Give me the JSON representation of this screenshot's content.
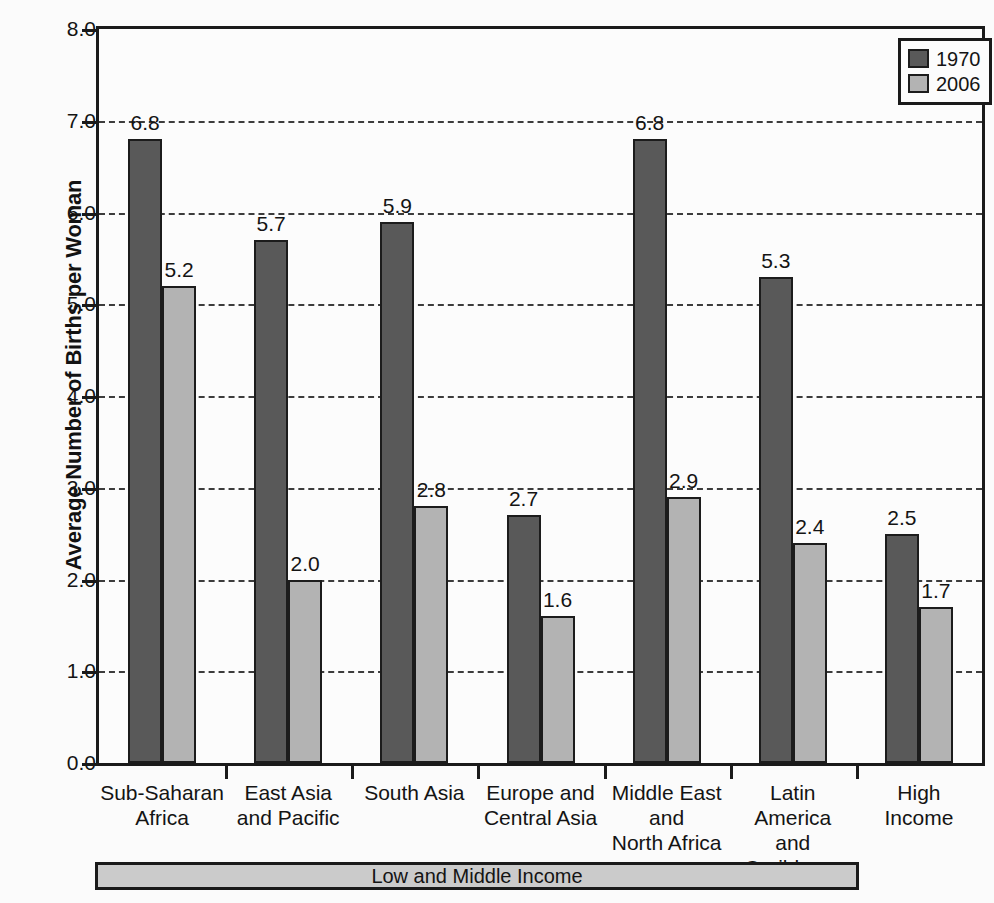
{
  "chart_data": {
    "type": "bar",
    "title": "",
    "xlabel": "",
    "ylabel": "Average Number of Births per Woman",
    "ylim": [
      0.0,
      8.0
    ],
    "ytick_labels": [
      "0.0",
      "1.0",
      "2.0",
      "3.0",
      "4.0",
      "5.0",
      "6.0",
      "7.0",
      "8.0"
    ],
    "ytick_values": [
      0.0,
      1.0,
      2.0,
      3.0,
      4.0,
      5.0,
      6.0,
      7.0,
      8.0
    ],
    "grid": true,
    "grid_axis": "y",
    "legend_position": "top-right",
    "categories": [
      "Sub-Saharan Africa",
      "East Asia and Pacific",
      "South Asia",
      "Europe and Central Asia",
      "Middle East and North Africa",
      "Latin America and Caribbean",
      "High Income"
    ],
    "category_lines": [
      [
        "Sub-Saharan",
        "Africa"
      ],
      [
        "East Asia",
        "and Pacific"
      ],
      [
        "South Asia"
      ],
      [
        "Europe and",
        "Central Asia"
      ],
      [
        "Middle East",
        "and",
        "North Africa"
      ],
      [
        "Latin America",
        "and",
        "Caribbean"
      ],
      [
        "High",
        "Income"
      ]
    ],
    "series": [
      {
        "name": "1970",
        "color": "#595959",
        "values": [
          6.8,
          5.7,
          5.9,
          2.7,
          6.8,
          5.3,
          2.5
        ],
        "labels": [
          "6.8",
          "5.7",
          "5.9",
          "2.7",
          "6.8",
          "5.3",
          "2.5"
        ]
      },
      {
        "name": "2006",
        "color": "#b3b3b3",
        "values": [
          5.2,
          2.0,
          2.8,
          1.6,
          2.9,
          2.4,
          1.7
        ],
        "labels": [
          "5.2",
          "2.0",
          "2.8",
          "1.6",
          "2.9",
          "2.4",
          "1.7"
        ]
      }
    ],
    "annotations": [
      {
        "text": "Low and Middle Income",
        "spans_categories": [
          "Sub-Saharan Africa",
          "East Asia and Pacific",
          "South Asia",
          "Europe and Central Asia",
          "Middle East and North Africa",
          "Latin America and Caribbean"
        ]
      }
    ]
  },
  "axis": {
    "ylabel": "Average Number of Births per Woman"
  },
  "legend": {
    "entries": [
      {
        "label": "1970",
        "color": "#595959"
      },
      {
        "label": "2006",
        "color": "#b3b3b3"
      }
    ]
  },
  "bracket": {
    "label": "Low and Middle Income"
  }
}
